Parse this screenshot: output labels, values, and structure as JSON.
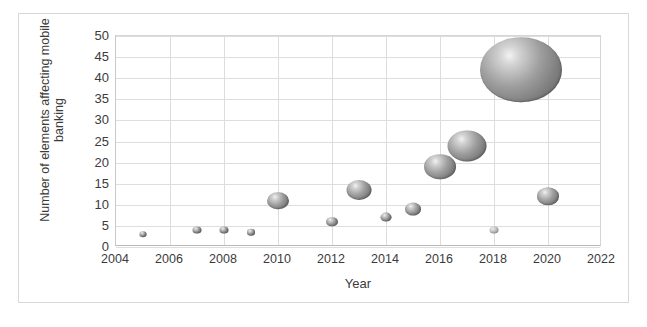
{
  "chart_data": {
    "type": "scatter",
    "title": "",
    "xlabel": "Year",
    "ylabel": "Number of elements affecting mobile\nbanking",
    "xlim": [
      2004,
      2022
    ],
    "ylim": [
      0,
      50
    ],
    "xticks": [
      2004,
      2006,
      2008,
      2010,
      2012,
      2014,
      2016,
      2018,
      2020,
      2022
    ],
    "yticks": [
      0,
      5,
      10,
      15,
      20,
      25,
      30,
      35,
      40,
      45,
      50
    ],
    "grid": true,
    "legend": "none",
    "marker_style": "3d-gradient-sphere",
    "marker_color": "#8a8a8a",
    "points": [
      {
        "label": "2005",
        "x": 2005,
        "y": 3,
        "size": 7,
        "faint": false
      },
      {
        "label": "2007",
        "x": 2007,
        "y": 4,
        "size": 9,
        "faint": false
      },
      {
        "label": "2008",
        "x": 2008,
        "y": 4,
        "size": 9,
        "faint": false
      },
      {
        "label": "2009",
        "x": 2009,
        "y": 3.5,
        "size": 8,
        "faint": false
      },
      {
        "label": "2010",
        "x": 2010,
        "y": 11,
        "size": 22,
        "faint": false
      },
      {
        "label": "2012",
        "x": 2012,
        "y": 6,
        "size": 12,
        "faint": false
      },
      {
        "label": "2013",
        "x": 2013,
        "y": 13.5,
        "size": 25,
        "faint": false
      },
      {
        "label": "2014",
        "x": 2014,
        "y": 7,
        "size": 11,
        "faint": false
      },
      {
        "label": "2015",
        "x": 2015,
        "y": 9,
        "size": 16,
        "faint": false
      },
      {
        "label": "2016",
        "x": 2016,
        "y": 19,
        "size": 32,
        "faint": false
      },
      {
        "label": "2017",
        "x": 2017,
        "y": 24,
        "size": 39,
        "faint": false
      },
      {
        "label": "2018",
        "x": 2018,
        "y": 4,
        "size": 9,
        "faint": true
      },
      {
        "label": "2019",
        "x": 2019,
        "y": 42,
        "size": 82,
        "faint": false
      },
      {
        "label": "2020",
        "x": 2020,
        "y": 12,
        "size": 22,
        "faint": false
      }
    ]
  }
}
